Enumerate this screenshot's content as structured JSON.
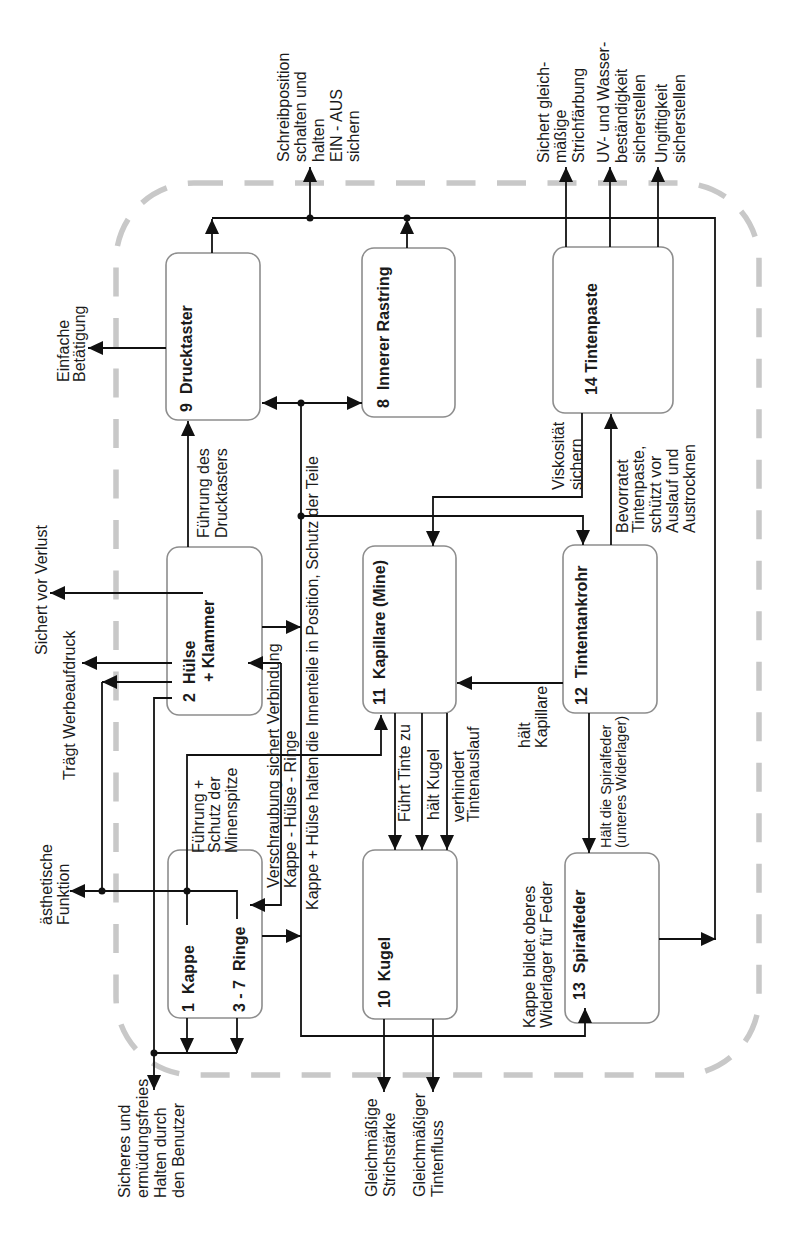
{
  "diagram": {
    "orientation": "rotated 90° counter-clockwise",
    "components": {
      "drucktaster": {
        "number": "9",
        "name": "Drucktaster"
      },
      "innerer_rastring": {
        "number": "8",
        "name": "Innerer Rastring"
      },
      "tintenpaste": {
        "number": "14",
        "name": "Tintenpaste"
      },
      "huelse_klammer": {
        "number": "2",
        "name": "Hülse",
        "name_line2": "+ Klammer"
      },
      "kapillare": {
        "number": "11",
        "name": "Kapillare (Mine)"
      },
      "tintentankrohr": {
        "number": "12",
        "name": "Tintentankrohr"
      },
      "kappe": {
        "number": "1",
        "name": "Kappe"
      },
      "ringe": {
        "number": "3 - 7",
        "name": "Ringe"
      },
      "kugel": {
        "number": "10",
        "name": "Kugel"
      },
      "spiralfeder": {
        "number": "13",
        "name": "Spiralfeder"
      }
    },
    "external_functions": {
      "einfache_betaetigung": [
        "Einfache",
        "Betätigung"
      ],
      "schreibposition": [
        "Schreibposition",
        "schalten und",
        "halten",
        "EIN - AUS",
        "sichern"
      ],
      "strichfaerbung": [
        "Sichert gleich-",
        "mäßige",
        "Strichfärbung"
      ],
      "uv_wasser": [
        "UV- und Wasser-",
        "beständigkeit",
        "sicherstellen"
      ],
      "ungiftigkeit": [
        "Ungiftigkeit",
        "sicherstellen"
      ],
      "sichert_vor_verlust": [
        "Sichert vor Verlust"
      ],
      "werbeaufdruck": [
        "Trägt Werbeaufdruck"
      ],
      "aesthetische_funktion": [
        "ästhetische",
        "Funktion"
      ],
      "sicheres_halten": [
        "Sicheres und",
        "ermüdungsfreies",
        "Halten durch",
        "den Benutzer"
      ],
      "strichstaerke": [
        "Gleichmäßige",
        "Strichstärke"
      ],
      "tintenfluss": [
        "Gleichmäßiger",
        "Tintenfluss"
      ]
    },
    "internal_relations": {
      "fuehrung_drucktaster": [
        "Führung des",
        "Drucktasters"
      ],
      "fuehrung_minenspitze": [
        "Führung +",
        "Schutz der",
        "Minenspitze"
      ],
      "verschraubung": [
        "Verschraubung sichert Verbindung",
        "Kappe - Hülse - Ringe"
      ],
      "innenteile_position": [
        "Kappe + Hülse halten die Innenteile in Position, Schutz der Teile"
      ],
      "viskositaet": [
        "Viskosität",
        "sichern"
      ],
      "bevorratet": [
        "Bevorratet",
        "Tintenpaste,",
        "schützt vor",
        "Auslauf und",
        "Austrocknen"
      ],
      "fuehrt_tinte": [
        "Führt Tinte zu"
      ],
      "haelt_kugel": [
        "hält Kugel"
      ],
      "verhindert_auslauf": [
        "verhindert",
        "Tintenauslauf"
      ],
      "haelt_kapillare": [
        "hält",
        "Kapillare"
      ],
      "haelt_spiralfeder": [
        "Hält die Spiralfeder",
        "(unteres Widerlager)"
      ],
      "widerlager_feder": [
        "Kappe bildet oberes",
        "Widerlager für Feder"
      ]
    },
    "colors": {
      "line": "#111111",
      "box_border": "#8d8d8d",
      "system_boundary": "#c8c8c8",
      "text": "#1b1b1b",
      "background": "#ffffff"
    }
  }
}
